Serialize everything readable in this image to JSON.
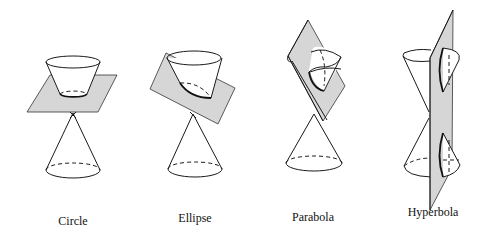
{
  "diagram": {
    "title": "",
    "colors": {
      "plane": "#d6d6d6",
      "line": "#1a1a1a",
      "background": "#ffffff"
    },
    "figures": [
      {
        "id": "circle",
        "label": "Circle",
        "label_x": 73,
        "label_y": 222
      },
      {
        "id": "ellipse",
        "label": "Ellipse",
        "label_x": 195,
        "label_y": 219
      },
      {
        "id": "parabola",
        "label": "Parabola",
        "label_x": 313,
        "label_y": 217
      },
      {
        "id": "hyperbola",
        "label": "Hyperbola",
        "label_x": 433,
        "label_y": 212
      }
    ]
  }
}
